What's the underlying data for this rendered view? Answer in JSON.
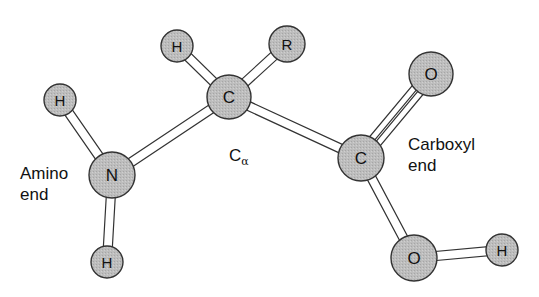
{
  "diagram": {
    "colors": {
      "atom_fill": "#b8b8b8",
      "atom_stroke": "#333333",
      "bond_fill": "#ffffff",
      "bond_stroke": "#333333",
      "text": "#111111"
    },
    "atoms": [
      {
        "id": "h_amino_top",
        "label": "H",
        "x": 60,
        "y": 100,
        "r": 16
      },
      {
        "id": "n",
        "label": "N",
        "x": 112,
        "y": 175,
        "r": 23
      },
      {
        "id": "h_amino_bottom",
        "label": "H",
        "x": 107,
        "y": 262,
        "r": 16
      },
      {
        "id": "h_alpha",
        "label": "H",
        "x": 177,
        "y": 46,
        "r": 16
      },
      {
        "id": "c_alpha",
        "label": "C",
        "x": 229,
        "y": 97,
        "r": 22
      },
      {
        "id": "r_group",
        "label": "R",
        "x": 287,
        "y": 44,
        "r": 18
      },
      {
        "id": "c_carboxyl",
        "label": "C",
        "x": 361,
        "y": 158,
        "r": 23
      },
      {
        "id": "o_double",
        "label": "O",
        "x": 431,
        "y": 74,
        "r": 22
      },
      {
        "id": "o_hydroxyl",
        "label": "O",
        "x": 414,
        "y": 258,
        "r": 23
      },
      {
        "id": "h_hydroxyl",
        "label": "H",
        "x": 502,
        "y": 250,
        "r": 16
      }
    ],
    "bonds": [
      {
        "from": "h_amino_top",
        "to": "n",
        "type": "single"
      },
      {
        "from": "n",
        "to": "h_amino_bottom",
        "type": "single"
      },
      {
        "from": "n",
        "to": "c_alpha",
        "type": "single"
      },
      {
        "from": "h_alpha",
        "to": "c_alpha",
        "type": "single"
      },
      {
        "from": "c_alpha",
        "to": "r_group",
        "type": "single"
      },
      {
        "from": "c_alpha",
        "to": "c_carboxyl",
        "type": "single"
      },
      {
        "from": "c_carboxyl",
        "to": "o_double",
        "type": "double"
      },
      {
        "from": "c_carboxyl",
        "to": "o_hydroxyl",
        "type": "single"
      },
      {
        "from": "o_hydroxyl",
        "to": "h_hydroxyl",
        "type": "single"
      }
    ],
    "labels": {
      "amino_line1": "Amino",
      "amino_line2": "end",
      "carboxyl_line1": "Carboxyl",
      "carboxyl_line2": "end",
      "alpha_main": "C",
      "alpha_sub": "α"
    }
  }
}
